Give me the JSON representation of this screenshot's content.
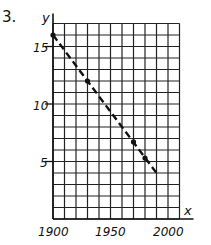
{
  "problem_number": "3.",
  "chart_data": {
    "type": "line",
    "title": "",
    "xlabel": "x",
    "ylabel": "y",
    "xlim": [
      1900,
      2010
    ],
    "ylim": [
      0,
      17
    ],
    "grid": true,
    "x_grid_step": 10,
    "y_grid_step": 1,
    "x_ticks": [
      1900,
      1950,
      2000
    ],
    "x_tick_labels": [
      "1900",
      "1950",
      "2000"
    ],
    "y_ticks": [
      5,
      10,
      15
    ],
    "y_tick_labels": [
      "5",
      "10",
      "15"
    ],
    "series": [
      {
        "name": "dashed trend line",
        "style": "dashed",
        "x": [
          1900,
          1990
        ],
        "values": [
          16,
          4
        ]
      },
      {
        "name": "data points",
        "style": "markers",
        "x": [
          1900,
          1930,
          1970,
          1980
        ],
        "values": [
          16,
          12,
          6.7,
          5.3
        ]
      }
    ]
  }
}
